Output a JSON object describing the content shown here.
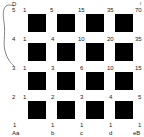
{
  "corner_top_left": "D",
  "corner_top_right": "I",
  "row_labels": [
    "5",
    "4",
    "3",
    "2",
    "1"
  ],
  "column_labels": [
    "Aa",
    "b",
    "c",
    "d",
    "eB"
  ],
  "lattice_values": [
    [
      "1",
      "5",
      "15",
      "35",
      "70"
    ],
    [
      "1",
      "4",
      "10",
      "20",
      "35"
    ],
    [
      "1",
      "3",
      "6",
      "10",
      "15"
    ],
    [
      "1",
      "2",
      "3",
      "4",
      "5"
    ],
    [
      "1",
      "1",
      "1",
      "1",
      "1"
    ]
  ],
  "square_color": "#000000"
}
